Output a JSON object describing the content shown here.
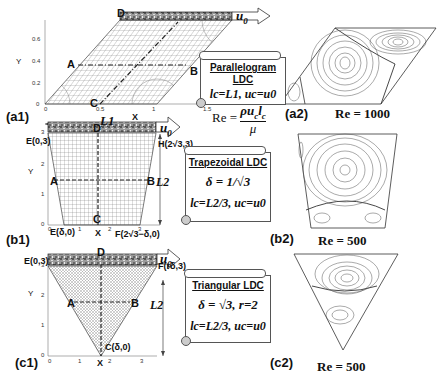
{
  "figure": {
    "panels": {
      "a1": "(a1)",
      "a2": "(a2)",
      "b1": "(b1)",
      "b2": "(b2)",
      "c1": "(c1)",
      "c2": "(c2)"
    },
    "reynolds_formula": {
      "lhs": "Re =",
      "numerator": "ρu",
      "num_sub1": "c",
      "num_l": "l",
      "num_sub2": "c",
      "denominator": "μ"
    },
    "lid_velocity_label": "u",
    "lid_velocity_sub": "0",
    "parallelogram": {
      "title_line1": "Parallelogram",
      "title_line2": "LDC",
      "condition": "lc=L1, uc=u0",
      "points": {
        "A": "A",
        "B": "B",
        "C": "C",
        "D": "D"
      },
      "y_label": "Y",
      "x_label": "X",
      "dimension": "L1",
      "y_ticks": [
        "0",
        "0.2",
        "0.4",
        "0.6"
      ],
      "x_ticks": [
        "0",
        "0.5",
        "1",
        "1.5"
      ],
      "re_label": "Re = 1000"
    },
    "trapezoidal": {
      "title": "Trapezoidal LDC",
      "delta_eq": "δ = 1/√3",
      "condition": "lc=L2/3, uc=u0",
      "points": {
        "A": "A",
        "B": "B",
        "C": "C",
        "D": "D",
        "E_top": "E(0,3)",
        "H": "H(2√3,3)",
        "E_bot": "E(δ,0)",
        "F": "F(2√3−δ,0)"
      },
      "y_label": "Y",
      "x_label": "X",
      "dimension": "L2",
      "y_ticks": [
        "0",
        "1",
        "2",
        "3"
      ],
      "x_ticks": [
        "0",
        "1",
        "2",
        "3"
      ],
      "re_label": "Re = 500"
    },
    "triangular": {
      "title": "Triangular LDC",
      "delta_eq": "δ = √3, r=2",
      "condition": "lc=L2/3, uc=u0",
      "points": {
        "A": "A",
        "B": "B",
        "C": "C(δ,0)",
        "D": "D",
        "E": "E(0,3)",
        "F": "F(rδ,3)"
      },
      "y_label": "Y",
      "x_label": "X",
      "dimension": "L2",
      "y_ticks": [
        "0",
        "1",
        "2",
        "3"
      ],
      "x_ticks": [
        "0",
        "1",
        "2",
        "3"
      ],
      "re_label": "Re = 500"
    }
  }
}
